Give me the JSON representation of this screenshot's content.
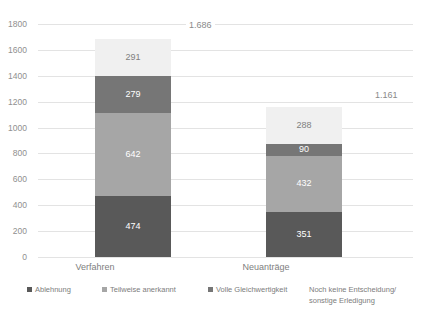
{
  "title": "",
  "chart_data": {
    "type": "bar",
    "stacked": true,
    "title": "",
    "xlabel": "",
    "ylabel": "",
    "ylim": [
      0,
      1800
    ],
    "ytick_step": 200,
    "ytick_labels": [
      "1800",
      "1600",
      "1400",
      "1200",
      "1000",
      "800",
      "600",
      "400",
      "200",
      "0"
    ],
    "ytick_values": [
      1800,
      1600,
      1400,
      1200,
      1000,
      800,
      600,
      400,
      200,
      0
    ],
    "grid": true,
    "legend_position": "bottom",
    "categories": [
      "Verfahren",
      "Neuanträge"
    ],
    "series": [
      {
        "name": "Ablehnung",
        "color": "#595959",
        "label_color": "#ffffff",
        "values": [
          474,
          351
        ],
        "labels": [
          "474",
          "351"
        ]
      },
      {
        "name": "Teilweise anerkannt",
        "color": "#a6a6a6",
        "label_color": "#ffffff",
        "values": [
          642,
          432
        ],
        "labels": [
          "642",
          "432"
        ]
      },
      {
        "name": "Volle Gleichwertigkeit",
        "color": "#767676",
        "label_color": "#ffffff",
        "values": [
          279,
          90
        ],
        "labels": [
          "279",
          "90"
        ]
      },
      {
        "name": "Noch keine Entscheidung/ sonstige Erledigung",
        "name_line1": "Noch keine Entscheidung/",
        "name_line2": "sonstige Erledigung",
        "color": "#f0f0f0",
        "label_color": "#808080",
        "values": [
          291,
          288
        ],
        "labels": [
          "291",
          "288"
        ]
      }
    ],
    "totals": [
      1686,
      1161
    ],
    "total_labels": [
      "1.686",
      "1.161"
    ],
    "annotations": [
      "1.686",
      "1.161"
    ]
  },
  "axis": {
    "gridline_color": "#e3e3e3",
    "tick_text_color": "#8f8f8f"
  }
}
